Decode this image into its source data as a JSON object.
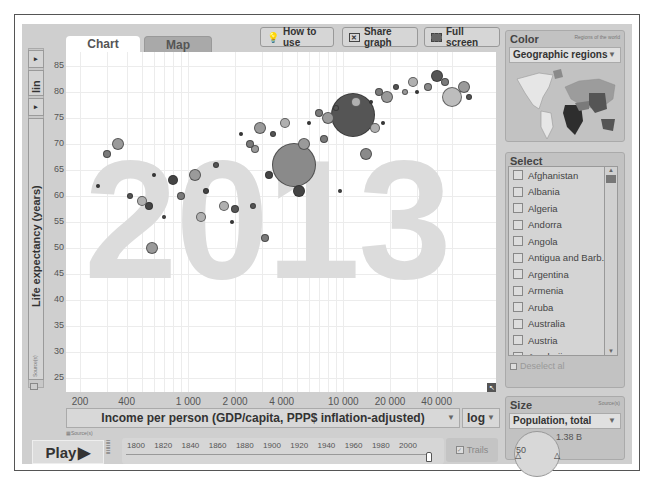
{
  "tabs": [
    {
      "label": "Chart",
      "active": true
    },
    {
      "label": "Map",
      "active": false
    }
  ],
  "toolbar": {
    "how_to_use": "How to use",
    "share_graph": "Share graph",
    "full_screen": "Full screen"
  },
  "y_axis": {
    "scale": "lin",
    "label": "Life expectancy (years)",
    "sources": "Source(s)",
    "ticks": [
      "85",
      "80",
      "75",
      "70",
      "65",
      "60",
      "55",
      "50",
      "45",
      "40",
      "35",
      "30",
      "25"
    ]
  },
  "x_axis": {
    "label": "Income per person (GDP/capita, PPP$ inflation-adjusted)",
    "scale": "log",
    "sources": "Source(s)",
    "ticks": [
      "200",
      "400",
      "1 000",
      "2 000",
      "4 000",
      "10 000",
      "20 000",
      "40 000"
    ]
  },
  "year_watermark": "2013",
  "play": {
    "label": "Play"
  },
  "timeline": {
    "ticks": [
      "1800",
      "1820",
      "1840",
      "1860",
      "1880",
      "1900",
      "1920",
      "1940",
      "1960",
      "1980",
      "2000"
    ],
    "current": "2013"
  },
  "trails": {
    "label": "Trails"
  },
  "color_panel": {
    "title": "Color",
    "note": "Regions of the world",
    "selected": "Geographic regions"
  },
  "select_panel": {
    "title": "Select",
    "items": [
      "Afghanistan",
      "Albania",
      "Algeria",
      "Andorra",
      "Angola",
      "Antigua and Barb...",
      "Argentina",
      "Armenia",
      "Aruba",
      "Australia",
      "Austria",
      "Azerbaijan",
      "Bahamas"
    ],
    "deselect_all": "Deselect al"
  },
  "size_panel": {
    "title": "Size",
    "note": "Source(s)",
    "selected": "Population, total",
    "max_label": "1.38 B",
    "min_label": "50"
  },
  "chart_data": {
    "type": "scatter",
    "title": "2013",
    "xlabel": "Income per person (GDP/capita, PPP$ inflation-adjusted)",
    "ylabel": "Life expectancy (years)",
    "xscale": "log",
    "xlim": [
      150,
      80000
    ],
    "ylim": [
      22,
      87
    ],
    "x_ticks": [
      200,
      400,
      1000,
      2000,
      4000,
      10000,
      20000,
      40000
    ],
    "y_ticks": [
      25,
      30,
      35,
      40,
      45,
      50,
      55,
      60,
      65,
      70,
      75,
      80,
      85
    ],
    "points": [
      {
        "x": 11500,
        "y": 75.5,
        "r": 22,
        "color": "#555555"
      },
      {
        "x": 4800,
        "y": 66,
        "r": 22,
        "color": "#8a8a8a"
      },
      {
        "x": 50000,
        "y": 79,
        "r": 10,
        "color": "#bdbdbd"
      },
      {
        "x": 40000,
        "y": 83,
        "r": 6,
        "color": "#555555"
      },
      {
        "x": 5200,
        "y": 61,
        "r": 6,
        "color": "#444444"
      },
      {
        "x": 2700,
        "y": 69,
        "r": 4,
        "color": "#9a9a9a"
      },
      {
        "x": 14000,
        "y": 68,
        "r": 6,
        "color": "#8a8a8a"
      },
      {
        "x": 800,
        "y": 63,
        "r": 5,
        "color": "#444444"
      },
      {
        "x": 560,
        "y": 58,
        "r": 4,
        "color": "#444444"
      },
      {
        "x": 2000,
        "y": 57.5,
        "r": 4,
        "color": "#555555"
      },
      {
        "x": 1300,
        "y": 61,
        "r": 3,
        "color": "#444444"
      },
      {
        "x": 3300,
        "y": 64,
        "r": 4,
        "color": "#444444"
      },
      {
        "x": 35000,
        "y": 81,
        "r": 4,
        "color": "#888888"
      },
      {
        "x": 25000,
        "y": 80,
        "r": 3,
        "color": "#999999"
      },
      {
        "x": 700,
        "y": 56,
        "r": 2,
        "color": "#444444"
      },
      {
        "x": 9500,
        "y": 61,
        "r": 2,
        "color": "#444444"
      }
    ]
  }
}
